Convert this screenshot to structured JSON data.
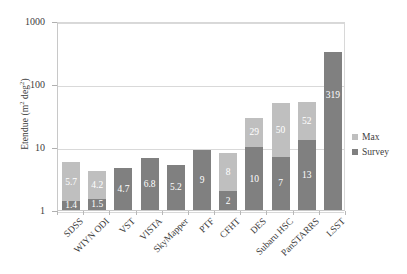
{
  "chart_data": {
    "type": "bar",
    "stacked": true,
    "title": "",
    "xlabel": "",
    "ylabel": "Etendue (m² deg²)",
    "ylabel_base": "Etendue (m",
    "ylabel_sup1": "2",
    "ylabel_mid": " deg",
    "ylabel_sup2": "2",
    "ylabel_end": ")",
    "yscale": "log",
    "ylim": [
      1,
      1000
    ],
    "ytick_labels": [
      "1000",
      "100",
      "10",
      "1"
    ],
    "ytick_values": [
      1000,
      100,
      10,
      1
    ],
    "grid": true,
    "legend_position": "right",
    "categories": [
      "SDSS",
      "WIYN ODI",
      "VST",
      "VISTA",
      "SkyMapper",
      "PTF",
      "CFHT",
      "DES",
      "Subaru HSC",
      "PanSTARRS",
      "LSST"
    ],
    "series": [
      {
        "name": "Survey",
        "color": "#808080",
        "values": [
          1.4,
          1.5,
          4.7,
          6.8,
          5.2,
          9,
          2,
          10,
          7,
          13,
          319
        ],
        "labels": [
          "1.4",
          "1.5",
          "4.7",
          "6.8",
          "5.2",
          "9",
          "2",
          "10",
          "7",
          "13",
          "319"
        ]
      },
      {
        "name": "Max",
        "color": "#bfbfbf",
        "values": [
          5.7,
          4.2,
          null,
          null,
          null,
          null,
          8,
          29,
          50,
          52,
          null
        ],
        "labels": [
          "5.7",
          "4.2",
          "",
          "",
          "",
          "",
          "8",
          "29",
          "50",
          "52",
          ""
        ]
      }
    ],
    "legend": [
      {
        "label": "Max",
        "color": "#bfbfbf"
      },
      {
        "label": "Survey",
        "color": "#808080"
      }
    ]
  },
  "colors": {
    "max": "#bfbfbf",
    "survey": "#808080",
    "grid": "#d9d9d9",
    "axis": "#c8c8c8",
    "text": "#3d3d3d",
    "label_on_bar": "#ffffff",
    "background": "#ffffff"
  }
}
